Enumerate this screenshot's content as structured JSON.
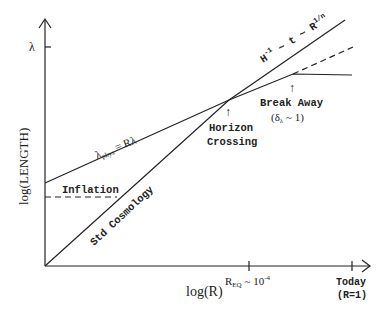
{
  "axes": {
    "y_label": "log(LENGTH)",
    "x_label": "log(R)",
    "y_tick_label": "λ",
    "x_ticks": [
      {
        "label_base": "R",
        "label_sub": "EQ",
        "label_rest": " ~ 10",
        "label_sup": "-4"
      },
      {
        "label_line1": "Today",
        "label_line2": "(R=1)"
      }
    ]
  },
  "curves": {
    "hubble": {
      "label_base": "H",
      "label_sup1": "-1",
      "label_mid": " ~ t ~ R",
      "label_sup2": "1/n"
    },
    "lambda_phys": {
      "label_base": "λ",
      "label_sub": "phys",
      "label_rest": " = Rλ"
    },
    "std_cosmology": {
      "label": "Std Cosmology"
    },
    "inflation": {
      "label": "Inflation"
    }
  },
  "annotations": {
    "horizon_crossing": {
      "line1": "Horizon",
      "line2": "Crossing",
      "arrow": "↑"
    },
    "break_away": {
      "line1": "Break Away",
      "line2_open": "(δ",
      "line2_sub": "λ",
      "line2_close": " ~ 1)",
      "arrow": "↑"
    }
  },
  "colors": {
    "ink": "#222222",
    "background": "#ffffff"
  }
}
